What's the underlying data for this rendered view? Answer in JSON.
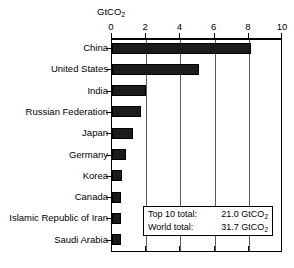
{
  "chart_data": {
    "type": "bar",
    "orientation": "horizontal",
    "title": "",
    "subtitle": "",
    "xlabel": "GtCO2",
    "ylabel": "",
    "xlim": [
      0,
      10
    ],
    "xticks": [
      0,
      2,
      4,
      6,
      8,
      10
    ],
    "xtick_labels": [
      "0",
      "2",
      "4",
      "6",
      "8",
      "10"
    ],
    "grid": true,
    "grid_axis": "x",
    "legend": null,
    "categories": [
      "China",
      "United States",
      "India",
      "Russian Federation",
      "Japan",
      "Germany",
      "Korea",
      "Canada",
      "Islamic Republic of Iran",
      "Saudi Arabia"
    ],
    "values": [
      8.1,
      5.1,
      2.0,
      1.7,
      1.2,
      0.8,
      0.6,
      0.5,
      0.5,
      0.5
    ],
    "units": "GtCO2",
    "bar_color": "#1b1b1b",
    "annotations": [
      {
        "label": "Top 10 total:",
        "value": "21.0 GtCO",
        "value_sub": "2"
      },
      {
        "label": "World total:",
        "value": "31.7 GtCO",
        "value_sub": "2"
      }
    ]
  },
  "axis": {
    "unit_label_main": "GtCO",
    "unit_label_sub": "2"
  }
}
